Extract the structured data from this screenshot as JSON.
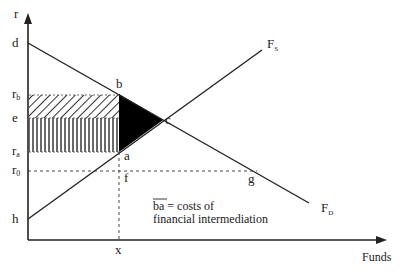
{
  "diagram": {
    "type": "loanable funds supply-demand with intermediation cost",
    "axes": {
      "y_label": "r",
      "x_label": "Funds"
    },
    "y_labels": {
      "d": "d",
      "rb_main": "r",
      "rb_sub": "b",
      "e": "e",
      "ra_main": "r",
      "ra_sub": "a",
      "r0_main": "r",
      "r0_sub": "0",
      "h": "h"
    },
    "x_labels": {
      "x": "x"
    },
    "points": {
      "b": "b",
      "c": "c",
      "a": "a",
      "f": "f",
      "g": "g"
    },
    "curves": {
      "fs_main": "F",
      "fs_sub": "S",
      "fd_main": "F",
      "fd_sub": "D"
    },
    "note": {
      "overline": "ba",
      "line1_rest": " = costs of",
      "line2": "financial intermediation"
    },
    "colors": {
      "line": "#222222",
      "fill": "#000000",
      "background": "#ffffff"
    }
  }
}
